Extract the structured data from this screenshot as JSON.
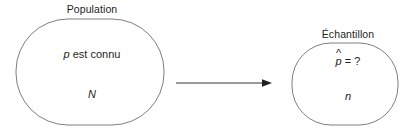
{
  "diagram": {
    "type": "statistics-sampling-diagram",
    "background_color": "#ffffff",
    "stroke_color": "#6f6f6f",
    "text_color": "#231f20",
    "population": {
      "caption": "Population",
      "known_parameter_symbol": "p",
      "known_parameter_text": "est connu",
      "size_symbol": "N"
    },
    "sample": {
      "caption": "Échantillon",
      "estimate_symbol": "p",
      "estimate_hat": "^",
      "estimate_relation": "= ?",
      "size_symbol": "n"
    },
    "arrow": {
      "name": "sampling-arrow",
      "direction": "left-to-right",
      "label": ""
    }
  }
}
